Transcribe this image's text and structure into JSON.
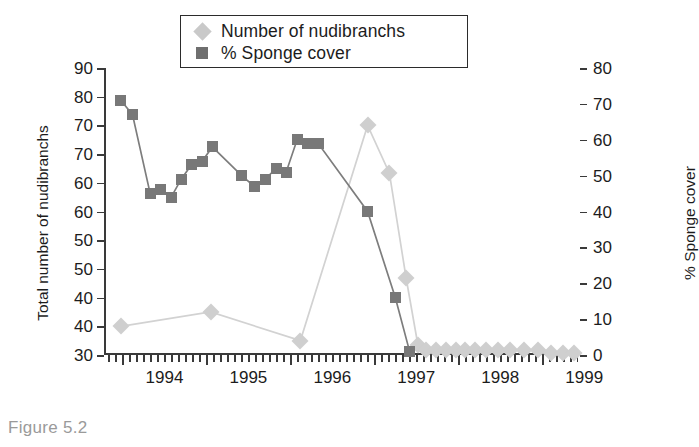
{
  "caption": "Figure 5.2",
  "legend": {
    "position": "top-center",
    "items": [
      {
        "label": "Number of nudibranchs",
        "marker": "diamond",
        "color": "#c9c9c9",
        "key_icon": "diamond-marker-icon"
      },
      {
        "label": "% Sponge cover",
        "marker": "square",
        "color": "#6f6f6f",
        "key_icon": "square-marker-icon"
      }
    ]
  },
  "axes": {
    "left_title": "Total number of nudibranchs",
    "right_title": "% Sponge cover",
    "left_ticks": [
      "90",
      "80",
      "70",
      "70",
      "60",
      "60",
      "50",
      "50",
      "40",
      "40",
      "30"
    ],
    "right_ticks": [
      "80",
      "70",
      "60",
      "50",
      "40",
      "30",
      "20",
      "10",
      "0"
    ],
    "x_ticks": [
      "1994",
      "1995",
      "1996",
      "1997",
      "1998",
      "1999"
    ]
  },
  "chart_data": {
    "type": "line",
    "title": "",
    "xlabel": "",
    "ylabel": "Total number of nudibranchs",
    "y2label": "% Sponge cover",
    "xlim": [
      1993.78,
      1999.45
    ],
    "ylim": [
      30,
      90
    ],
    "y2lim": [
      0,
      80
    ],
    "grid": false,
    "legend_position": "top-center",
    "x_tick_labels": [
      "1994",
      "1995",
      "1996",
      "1997",
      "1998",
      "1999"
    ],
    "x_tick_values": [
      1994,
      1995,
      1996,
      1997,
      1998,
      1999
    ],
    "y_tick_labels": [
      "90",
      "80",
      "70",
      "70",
      "60",
      "60",
      "50",
      "50",
      "40",
      "40",
      "30"
    ],
    "y2_tick_labels": [
      "80",
      "70",
      "60",
      "50",
      "40",
      "30",
      "20",
      "10",
      "0"
    ],
    "y2_tick_values": [
      80,
      70,
      60,
      50,
      40,
      30,
      20,
      10,
      0
    ],
    "series": [
      {
        "name": "% Sponge cover",
        "axis": "right",
        "marker": "square",
        "color": "#787878",
        "unit": "%",
        "points": [
          {
            "x": 1993.98,
            "y": 71
          },
          {
            "x": 1994.12,
            "y": 67
          },
          {
            "x": 1994.33,
            "y": 45
          },
          {
            "x": 1994.45,
            "y": 46
          },
          {
            "x": 1994.58,
            "y": 44
          },
          {
            "x": 1994.7,
            "y": 49
          },
          {
            "x": 1994.82,
            "y": 53
          },
          {
            "x": 1994.95,
            "y": 54
          },
          {
            "x": 1995.07,
            "y": 58
          },
          {
            "x": 1995.42,
            "y": 50
          },
          {
            "x": 1995.57,
            "y": 47
          },
          {
            "x": 1995.7,
            "y": 49
          },
          {
            "x": 1995.83,
            "y": 52
          },
          {
            "x": 1995.95,
            "y": 51
          },
          {
            "x": 1996.08,
            "y": 60
          },
          {
            "x": 1996.2,
            "y": 59
          },
          {
            "x": 1996.33,
            "y": 59
          },
          {
            "x": 1996.92,
            "y": 40
          },
          {
            "x": 1997.25,
            "y": 16
          },
          {
            "x": 1997.42,
            "y": 1
          }
        ]
      },
      {
        "name": "Number of nudibranchs",
        "axis": "left",
        "marker": "diamond",
        "color": "#cfcfcf",
        "unit": "count",
        "points": [
          {
            "x": 1993.98,
            "y": 36
          },
          {
            "x": 1995.05,
            "y": 39
          },
          {
            "x": 1996.12,
            "y": 33
          },
          {
            "x": 1996.92,
            "y": 78
          },
          {
            "x": 1997.18,
            "y": 68
          },
          {
            "x": 1997.38,
            "y": 46
          },
          {
            "x": 1997.52,
            "y": 32
          },
          {
            "x": 1997.62,
            "y": 31
          },
          {
            "x": 1997.73,
            "y": 31
          },
          {
            "x": 1997.85,
            "y": 31
          },
          {
            "x": 1997.97,
            "y": 31
          },
          {
            "x": 1998.08,
            "y": 31
          },
          {
            "x": 1998.2,
            "y": 31
          },
          {
            "x": 1998.33,
            "y": 31
          },
          {
            "x": 1998.47,
            "y": 31
          },
          {
            "x": 1998.62,
            "y": 31
          },
          {
            "x": 1998.78,
            "y": 31
          },
          {
            "x": 1998.95,
            "y": 31
          },
          {
            "x": 1999.1,
            "y": 30.5
          },
          {
            "x": 1999.25,
            "y": 30.5
          },
          {
            "x": 1999.38,
            "y": 30.5
          }
        ]
      }
    ]
  }
}
